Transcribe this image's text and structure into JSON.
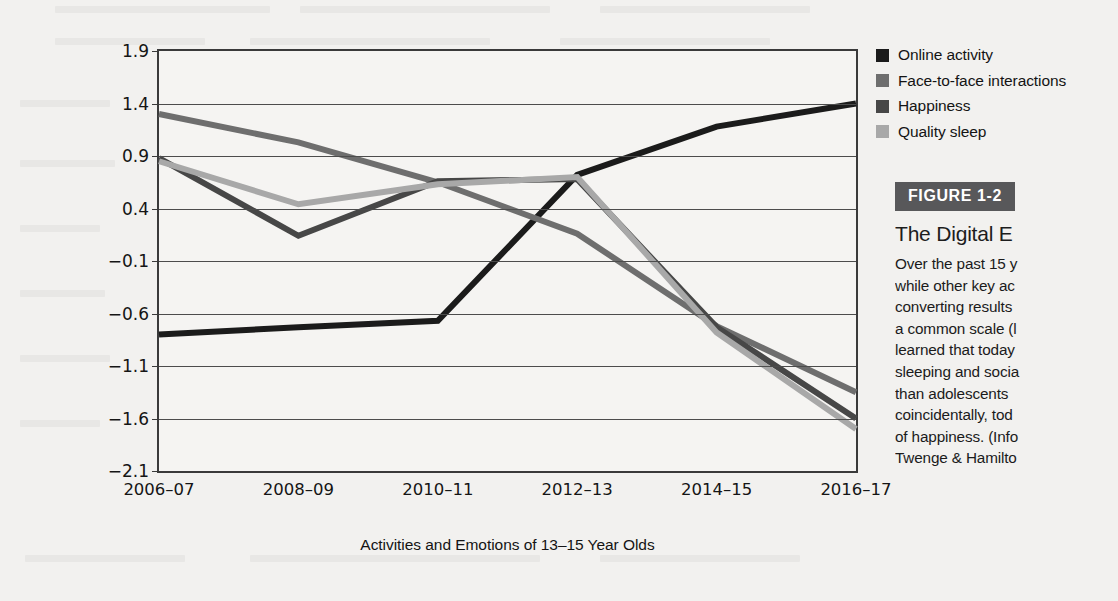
{
  "figure": {
    "banner": "FIGURE 1-2",
    "title": "The Digital E",
    "caption_lines": [
      "Over the past 15 y",
      "while other key ac",
      "converting results",
      "a common scale (l",
      "learned that today",
      "sleeping and socia",
      "than adolescents ",
      "coincidentally, tod",
      "of happiness. (Info",
      "Twenge & Hamilto"
    ]
  },
  "legend": {
    "items": [
      {
        "label": "Online activity",
        "color": "#1b1b1b"
      },
      {
        "label": "Face-to-face interactions",
        "color": "#6e6e6e"
      },
      {
        "label": "Happiness",
        "color": "#474747"
      },
      {
        "label": "Quality sleep",
        "color": "#a8a8a8"
      }
    ]
  },
  "chart_data": {
    "type": "line",
    "title": "",
    "xlabel": "Activities and Emotions of 13–15 Year Olds",
    "ylabel": "Average Daily Level of Activity or Emotion (z-scores)",
    "ylabel_line1": "Average Daily Level of Activity or",
    "ylabel_line2": "Emotion (z-scores)",
    "categories": [
      "2006–07",
      "2008–09",
      "2010–11",
      "2012–13",
      "2014–15",
      "2016–17"
    ],
    "yticks": [
      1.9,
      1.4,
      0.9,
      0.4,
      -0.1,
      -0.6,
      -1.1,
      -1.6,
      -2.1
    ],
    "ytick_labels": [
      "1.9",
      "1.4",
      "0.9",
      "0.4",
      "−0.1",
      "−0.6",
      "−1.1",
      "−1.6",
      "−2.1"
    ],
    "ylim": [
      -2.1,
      1.9
    ],
    "grid": true,
    "legend_position": "top-right",
    "series": [
      {
        "name": "Online activity",
        "color": "#1b1b1b",
        "width": 6,
        "values": [
          -0.8,
          -0.73,
          -0.67,
          0.72,
          1.18,
          1.4
        ]
      },
      {
        "name": "Face-to-face interactions",
        "color": "#6e6e6e",
        "width": 6,
        "values": [
          1.3,
          1.03,
          0.65,
          0.16,
          -0.72,
          -1.35
        ]
      },
      {
        "name": "Happiness",
        "color": "#474747",
        "width": 6,
        "values": [
          0.88,
          0.14,
          0.66,
          0.68,
          -0.73,
          -1.6
        ]
      },
      {
        "name": "Quality sleep",
        "color": "#a8a8a8",
        "width": 6,
        "values": [
          0.85,
          0.44,
          0.63,
          0.7,
          -0.78,
          -1.7
        ]
      }
    ]
  }
}
